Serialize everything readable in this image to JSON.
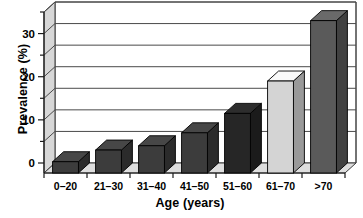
{
  "chart_data": {
    "type": "bar",
    "title": "",
    "subtitle": "",
    "xlabel": "Age (years)",
    "ylabel": "Prevalence (%)",
    "categories": [
      "0–20",
      "21–30",
      "31–40",
      "41–50",
      "51–60",
      "61–70",
      ">70"
    ],
    "values": [
      0.3,
      3.0,
      4.0,
      7.0,
      11.5,
      19.0,
      33.0
    ],
    "series": [
      {
        "name": "Prevalence",
        "values": [
          0.3,
          3.0,
          4.0,
          7.0,
          11.5,
          19.0,
          33.0
        ]
      }
    ],
    "ylim": [
      0,
      35
    ],
    "yticks": [
      0,
      10,
      20,
      30
    ],
    "ytick_labels": [
      "0",
      "10",
      "20",
      "30"
    ],
    "yminor_ticks": [
      5,
      15,
      25,
      35
    ],
    "grid": true,
    "grid_axis": "y",
    "grid_interval": 5,
    "legend": false,
    "legend_position": "none",
    "style": "3d-column",
    "bar_colors": [
      "#3c3c3c",
      "#3c3c3c",
      "#3c3c3c",
      "#3c3c3c",
      "#262626",
      "#d4d4d4",
      "#5a5a5a"
    ],
    "annotations": []
  },
  "axes": {
    "y_title": "Prevalence (%)",
    "x_title": "Age (years)"
  },
  "colors": {
    "background": "#ffffff",
    "axis": "#1a1a1a",
    "gridline": "#4a4a4a",
    "floor": "#dedede",
    "wall": "#d7d7d7",
    "bar_dark": "#3c3c3c",
    "bar_darkest": "#262626",
    "bar_light": "#d4d4d4",
    "bar_medium": "#5a5a5a"
  }
}
